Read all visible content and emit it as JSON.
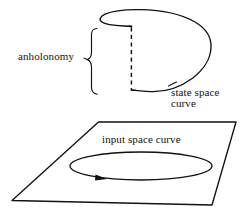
{
  "figure": {
    "background_color": "#ffffff",
    "ink_color": "#111111",
    "labels": {
      "anholonomy": "anholonomy",
      "state_space_line1": "state space",
      "state_space_line2": "curve",
      "input_space": "input space curve"
    },
    "elements": {
      "brace_name": "curly-brace",
      "state_curve_name": "state-space-open-loop",
      "gap_name": "anholonomy-gap-dashed-line",
      "plane_name": "input-space-plane",
      "loop_name": "input-space-closed-loop",
      "arrow_name": "direction-arrowhead"
    },
    "geometry": {
      "state_curve_top_y": 26,
      "state_curve_bottom_y": 90,
      "gap_x": 131,
      "plane_corners": "98,122 236,122 212,205 12,200",
      "loop_center": [
        141,
        166
      ],
      "loop_radii": [
        71,
        14
      ]
    }
  }
}
